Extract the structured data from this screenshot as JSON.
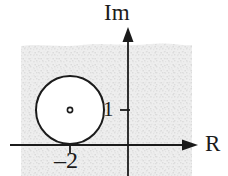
{
  "figure": {
    "kind": "complex-plane-diagram",
    "axes": {
      "imaginary_label": "Im",
      "real_label": "R",
      "origin": [
        128,
        145
      ],
      "real_axis_y": 145,
      "imag_axis_x": 128
    },
    "ticks": [
      {
        "label": "1",
        "axis": "imaginary",
        "value": 1,
        "position": [
          128,
          110
        ]
      },
      {
        "label": "–2",
        "axis": "real",
        "value": -2,
        "position": [
          70,
          145
        ]
      }
    ],
    "circle": {
      "center_label": "–2",
      "center": [
        70,
        110
      ],
      "radius": 34,
      "radius_value": 1,
      "fill": "#ffffff",
      "stroke": "#1b1b1b",
      "center_dot": true,
      "tangent_to": "real-axis"
    },
    "shaded_region": {
      "description": "stippled region of convergence",
      "fill": "#ececec",
      "stipple": "#d8d8d8",
      "bounds": {
        "x": 20,
        "y": 45,
        "width": 173,
        "height": 131
      }
    },
    "colors": {
      "ink": "#1b1b1b",
      "background": "#ffffff",
      "shade": "#ececec"
    }
  }
}
